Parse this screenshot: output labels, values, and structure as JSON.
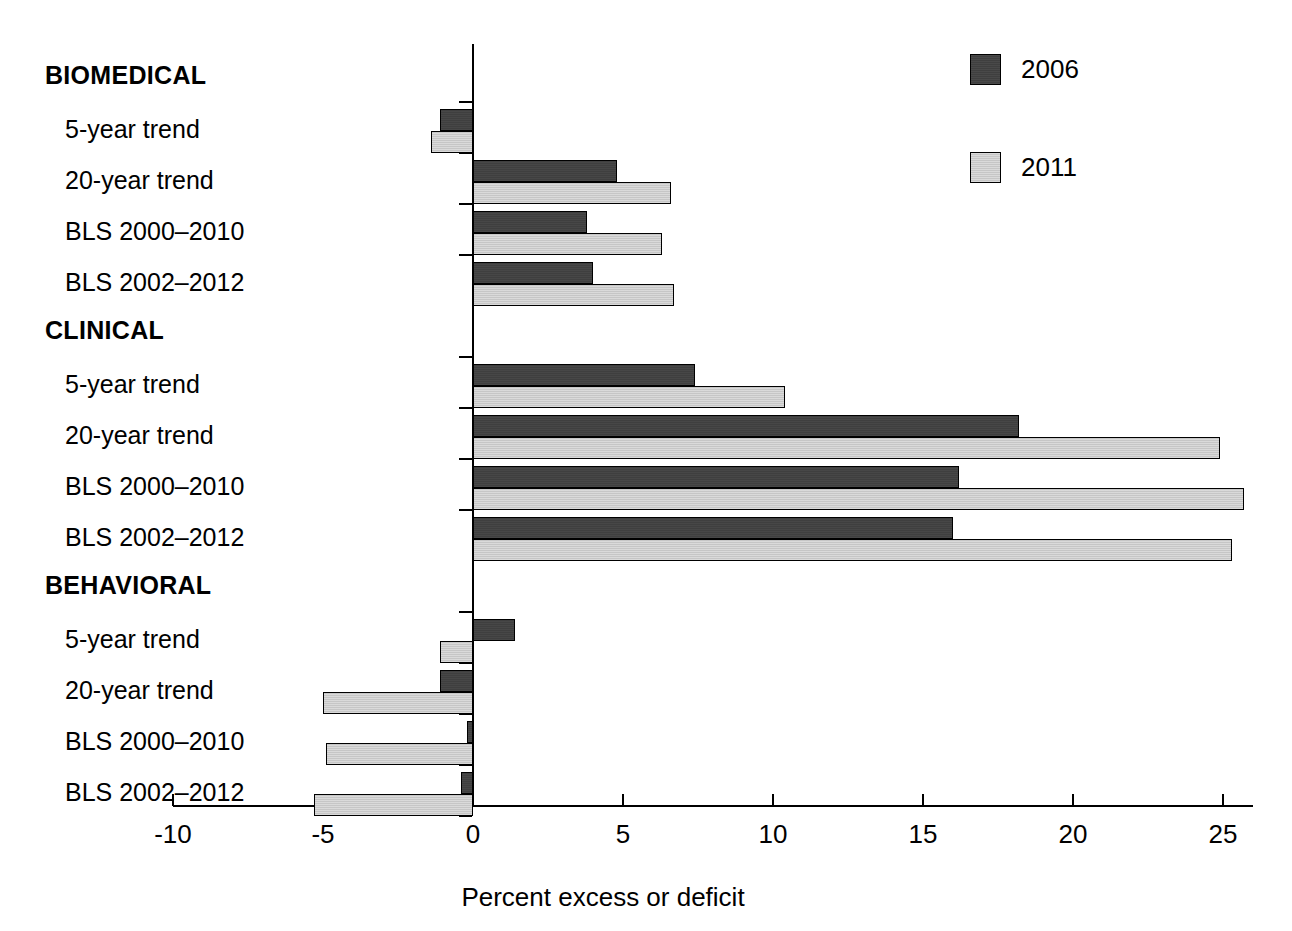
{
  "chart_data": {
    "type": "bar",
    "orientation": "horizontal",
    "title": "",
    "xlabel": "Percent excess or deficit",
    "ylabel": "",
    "xlim": [
      -10,
      26
    ],
    "xticks": [
      -10,
      -5,
      0,
      5,
      10,
      15,
      20,
      25
    ],
    "xticklabels": [
      "-10",
      "-5",
      "0",
      "5",
      "10",
      "15",
      "20",
      "25"
    ],
    "grid": false,
    "legend_position": "top-right",
    "series": [
      {
        "name": "2006",
        "color": "#3f3f3f"
      },
      {
        "name": "2011",
        "color": "#c6c6c6"
      }
    ],
    "groups": [
      {
        "name": "BIOMEDICAL",
        "rows": [
          {
            "category": "5-year trend",
            "values": {
              "2006": -1.1,
              "2011": -1.4
            }
          },
          {
            "category": "20-year trend",
            "values": {
              "2006": 4.8,
              "2011": 6.6
            }
          },
          {
            "category": "BLS 2000–2010",
            "values": {
              "2006": 3.8,
              "2011": 6.3
            }
          },
          {
            "category": "BLS 2002–2012",
            "values": {
              "2006": 4.0,
              "2011": 6.7
            }
          }
        ]
      },
      {
        "name": "CLINICAL",
        "rows": [
          {
            "category": "5-year trend",
            "values": {
              "2006": 7.4,
              "2011": 10.4
            }
          },
          {
            "category": "20-year trend",
            "values": {
              "2006": 18.2,
              "2011": 24.9
            }
          },
          {
            "category": "BLS 2000–2010",
            "values": {
              "2006": 16.2,
              "2011": 25.7
            }
          },
          {
            "category": "BLS 2002–2012",
            "values": {
              "2006": 16.0,
              "2011": 25.3
            }
          }
        ]
      },
      {
        "name": "BEHAVIORAL",
        "rows": [
          {
            "category": "5-year trend",
            "values": {
              "2006": 1.4,
              "2011": -1.1
            }
          },
          {
            "category": "20-year trend",
            "values": {
              "2006": -1.1,
              "2011": -5.0
            }
          },
          {
            "category": "BLS 2000–2010",
            "values": {
              "2006": -0.2,
              "2011": -4.9
            }
          },
          {
            "category": "BLS 2002–2012",
            "values": {
              "2006": -0.4,
              "2011": -5.3
            }
          }
        ]
      }
    ]
  },
  "legend": {
    "items": [
      {
        "label": "2006"
      },
      {
        "label": "2011"
      }
    ]
  },
  "axis": {
    "x_title": "Percent excess or deficit"
  }
}
